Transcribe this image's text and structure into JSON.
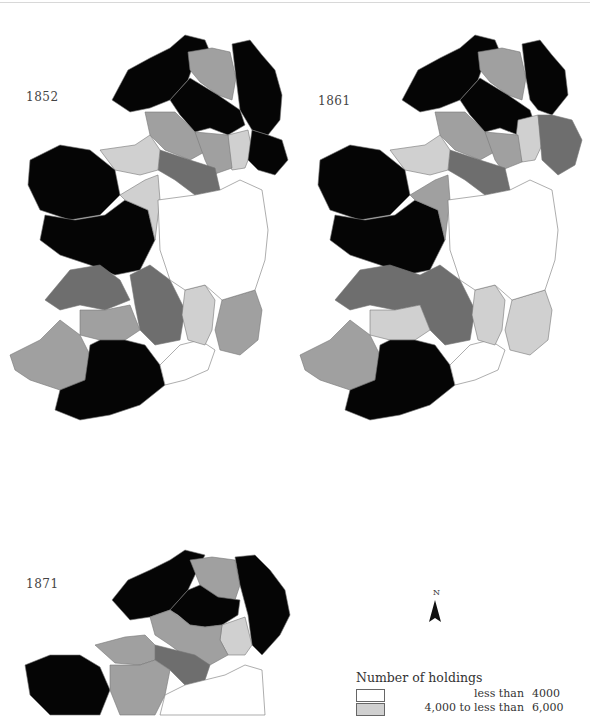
{
  "figure": {
    "maps": [
      {
        "year": "1852"
      },
      {
        "year": "1861"
      },
      {
        "year": "1871"
      }
    ],
    "north_arrow": {
      "label": "N"
    },
    "legend": {
      "title": "Number of holdings",
      "items": [
        {
          "label": "less than",
          "value": "4000",
          "color": "#ffffff"
        },
        {
          "label": "4,000 to less than",
          "value": "6,000",
          "color": "#d0d0d0"
        }
      ]
    },
    "colors": {
      "black": "#050505",
      "dark_grey": "#6e6e6e",
      "mid_grey": "#a0a0a0",
      "light_grey": "#d0d0d0",
      "white": "#ffffff",
      "border": "#777777"
    }
  }
}
